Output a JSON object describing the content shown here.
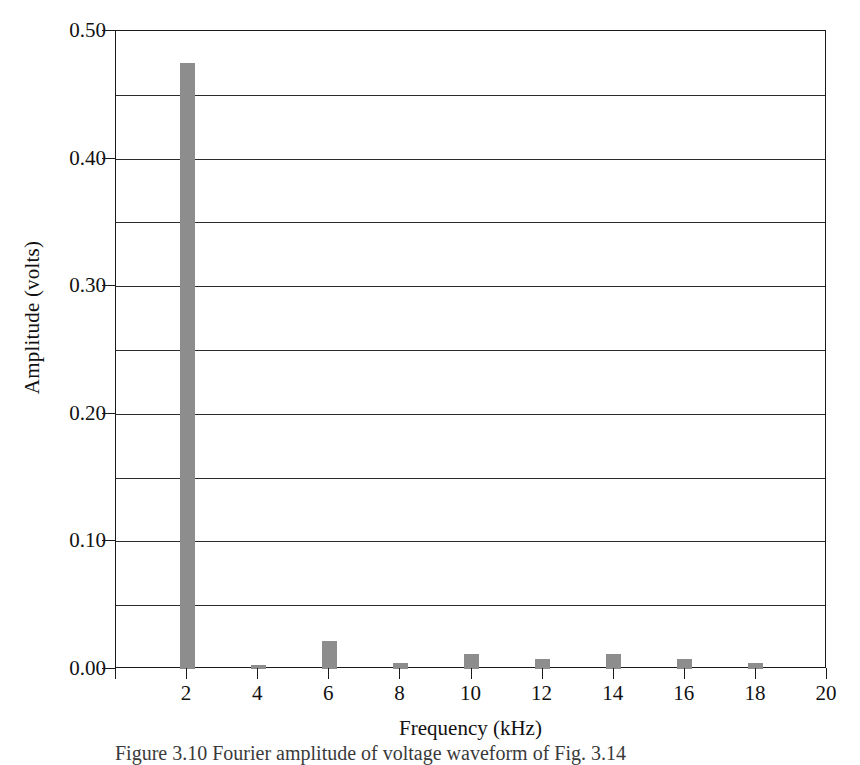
{
  "chart_data": {
    "type": "bar",
    "title": "",
    "xlabel": "Frequency (kHz)",
    "ylabel": "Amplitude (volts)",
    "categories": [
      2,
      4,
      6,
      8,
      10,
      12,
      14,
      16,
      18
    ],
    "values": [
      0.475,
      0.003,
      0.022,
      0.005,
      0.012,
      0.008,
      0.012,
      0.008,
      0.005
    ],
    "series": [
      {
        "name": "Fourier amplitude",
        "values": [
          0.475,
          0.003,
          0.022,
          0.005,
          0.012,
          0.008,
          0.012,
          0.008,
          0.005
        ]
      }
    ],
    "xlim": [
      0,
      20
    ],
    "ylim": [
      0.0,
      0.5
    ],
    "x_tick_labels": [
      "2",
      "4",
      "6",
      "8",
      "10",
      "12",
      "14",
      "16",
      "18",
      "20"
    ],
    "x_tick_values": [
      2,
      4,
      6,
      8,
      10,
      12,
      14,
      16,
      18,
      20
    ],
    "x_tick_step": 2,
    "y_tick_labels": [
      "0.00",
      "0.10",
      "0.20",
      "0.30",
      "0.40",
      "0.50"
    ],
    "y_tick_values": [
      0.0,
      0.1,
      0.2,
      0.3,
      0.4,
      0.5
    ],
    "y_gridline_values": [
      0.05,
      0.1,
      0.15,
      0.2,
      0.25,
      0.3,
      0.35,
      0.4,
      0.45,
      0.5
    ],
    "y_minor_step": 0.05,
    "grid": true,
    "grid_orientation": "horizontal",
    "legend": false,
    "legend_position": "none",
    "bar_color": "#8d8d8d",
    "axis_color": "#1a1a1a",
    "background_color": "#ffffff"
  },
  "caption": {
    "text": "Figure 3.10  Fourier amplitude of voltage waveform of Fig. 3.14",
    "note": "partially cropped at bottom edge of image"
  }
}
